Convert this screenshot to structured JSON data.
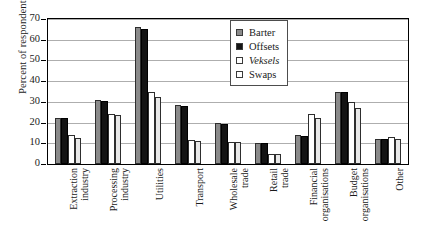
{
  "chart_data": {
    "type": "bar",
    "title": "",
    "xlabel": "",
    "ylabel": "Percent of respondents",
    "ylim": [
      0,
      70
    ],
    "ytick_step": 10,
    "yticks": [
      70,
      60,
      50,
      40,
      30,
      20,
      10,
      0
    ],
    "grid": true,
    "legend_position": "top-right",
    "categories": [
      "Extraction industry",
      "Processing industry",
      "Utilities",
      "Transport",
      "Wholesale trade",
      "Retail trade",
      "Financial organisations",
      "Budget organisations",
      "Other"
    ],
    "category_lines": [
      [
        "Extraction",
        "industry"
      ],
      [
        "Processing",
        "industry"
      ],
      [
        "Utilities"
      ],
      [
        "Transport"
      ],
      [
        "Wholesale",
        "trade"
      ],
      [
        "Retail",
        "trade"
      ],
      [
        "Financial",
        "organisations"
      ],
      [
        "Budget",
        "organisations"
      ],
      [
        "Other"
      ]
    ],
    "series": [
      {
        "name": "Barter",
        "color": "#8a8a8a",
        "values": [
          22,
          31,
          66,
          28.5,
          20,
          10,
          14,
          35,
          12
        ]
      },
      {
        "name": "Offsets",
        "color": "#141414",
        "values": [
          22,
          30.5,
          65,
          28,
          19.5,
          10,
          13.5,
          35,
          12
        ]
      },
      {
        "name": "Veksels",
        "color": "#ffffff",
        "values": [
          14,
          24,
          35,
          11.5,
          10.5,
          5,
          24,
          30,
          13
        ]
      },
      {
        "name": "Swaps",
        "color": "#e8e8e8",
        "values": [
          12.5,
          23.5,
          32.5,
          11,
          10.5,
          5,
          22,
          27,
          12
        ]
      }
    ]
  },
  "legend": {
    "items": [
      {
        "label": "Barter",
        "style": "normal"
      },
      {
        "label": "Offsets",
        "style": "normal"
      },
      {
        "label": "Veksels",
        "style": "italic"
      },
      {
        "label": "Swaps",
        "style": "normal"
      }
    ]
  },
  "axes": {
    "y_title": "Percent of respondents"
  }
}
